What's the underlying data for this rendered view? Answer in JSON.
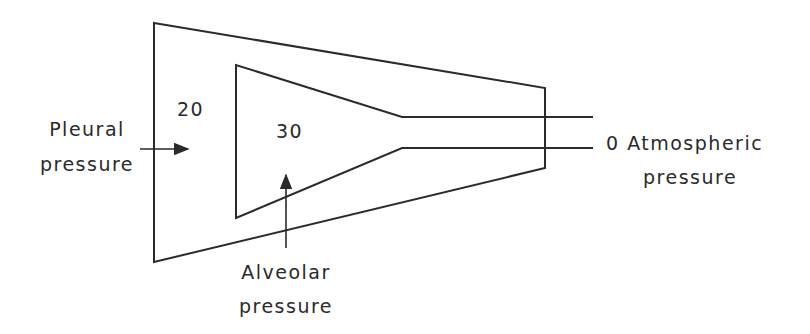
{
  "diagram": {
    "labels": {
      "pleural_value": "20",
      "alveolar_value": "30",
      "atmospheric_value": "0",
      "pleural_line1": "Pleural",
      "pleural_line2": "pressure",
      "alveolar_line1": "Alveolar",
      "alveolar_line2": "pressure",
      "atmospheric_line1": "0  Atmospheric",
      "atmospheric_line2": "pressure"
    },
    "colors": {
      "line": "#2a2a2a",
      "background": "#ffffff"
    }
  }
}
